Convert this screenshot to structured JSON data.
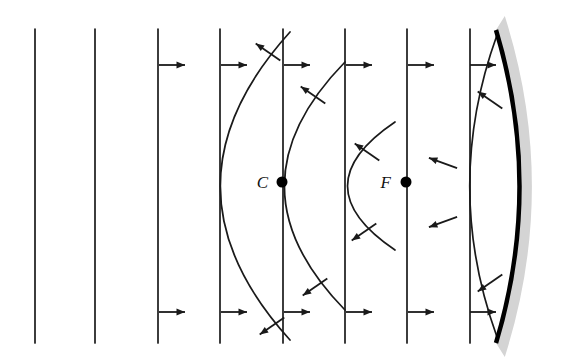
{
  "figure": {
    "background_color": "#ffffff",
    "width": 574,
    "height": 364,
    "stroke_color": "#1a1a1a",
    "mirror_color": "#000000",
    "mirror_backing_color": "#d4d4d4"
  },
  "points": [
    {
      "id": "center-of-curvature",
      "label": "C",
      "label_x": 268,
      "label_y": 188,
      "dot_x": 282,
      "dot_y": 182,
      "dot_r": 5.5
    },
    {
      "id": "focal-point",
      "label": "F",
      "label_x": 391,
      "label_y": 188,
      "dot_x": 406,
      "dot_y": 182,
      "dot_r": 5.5
    }
  ],
  "plane_wavefronts": [
    {
      "id": "plane-1",
      "x": 35,
      "y_top": 29,
      "y_bottom": 343
    },
    {
      "id": "plane-2",
      "x": 95,
      "y_top": 29,
      "y_bottom": 343
    },
    {
      "id": "plane-3",
      "x": 158,
      "y_top": 29,
      "y_bottom": 343
    },
    {
      "id": "plane-4",
      "x": 220,
      "y_top": 29,
      "y_bottom": 343
    },
    {
      "id": "plane-5",
      "x": 283,
      "y_top": 29,
      "y_bottom": 343
    },
    {
      "id": "plane-6",
      "x": 345,
      "y_top": 29,
      "y_bottom": 343
    },
    {
      "id": "plane-7",
      "x": 407,
      "y_top": 29,
      "y_bottom": 343
    },
    {
      "id": "plane-8",
      "x": 470,
      "y_top": 29,
      "y_bottom": 343
    }
  ],
  "curved_wavefronts": [
    {
      "id": "curved-1",
      "apex_x": 221,
      "top_x": 290,
      "bottom_x": 290,
      "y_top": 32,
      "y_bottom": 340
    },
    {
      "id": "curved-2",
      "apex_x": 285,
      "top_x": 345,
      "bottom_x": 345,
      "y_top": 62,
      "y_bottom": 310
    },
    {
      "id": "curved-3",
      "apex_x": 348,
      "top_x": 395,
      "bottom_x": 395,
      "y_top": 122,
      "y_bottom": 250
    },
    {
      "id": "curved-4",
      "apex_x": 470,
      "top_x": 497,
      "bottom_x": 497,
      "y_top": 35,
      "y_bottom": 337
    }
  ],
  "mirror": {
    "id": "concave-mirror",
    "top_x": 496,
    "top_y": 30,
    "bottom_x": 496,
    "bottom_y": 343,
    "apex_x": 543,
    "line_width": 4.5,
    "backing_width": 16
  },
  "incident_arrows": [
    {
      "id": "incident-arrow-top-1",
      "x": 163,
      "y": 65,
      "dir": "right"
    },
    {
      "id": "incident-arrow-top-2",
      "x": 225,
      "y": 65,
      "dir": "right"
    },
    {
      "id": "incident-arrow-top-3",
      "x": 288,
      "y": 65,
      "dir": "right"
    },
    {
      "id": "incident-arrow-top-4",
      "x": 350,
      "y": 65,
      "dir": "right"
    },
    {
      "id": "incident-arrow-top-5",
      "x": 412,
      "y": 65,
      "dir": "right"
    },
    {
      "id": "incident-arrow-top-6",
      "x": 474,
      "y": 65,
      "dir": "right"
    },
    {
      "id": "incident-arrow-bottom-1",
      "x": 163,
      "y": 312,
      "dir": "right"
    },
    {
      "id": "incident-arrow-bottom-2",
      "x": 225,
      "y": 312,
      "dir": "right"
    },
    {
      "id": "incident-arrow-bottom-3",
      "x": 288,
      "y": 312,
      "dir": "right"
    },
    {
      "id": "incident-arrow-bottom-4",
      "x": 350,
      "y": 312,
      "dir": "right"
    },
    {
      "id": "incident-arrow-bottom-5",
      "x": 412,
      "y": 312,
      "dir": "right"
    },
    {
      "id": "incident-arrow-bottom-6",
      "x": 474,
      "y": 312,
      "dir": "right"
    }
  ],
  "reflected_arrows": [
    {
      "id": "reflected-arrow-upper-1",
      "x": 268,
      "y": 52,
      "angle": -145
    },
    {
      "id": "reflected-arrow-upper-2",
      "x": 313,
      "y": 95,
      "angle": -145
    },
    {
      "id": "reflected-arrow-upper-3",
      "x": 367,
      "y": 152,
      "angle": -145
    },
    {
      "id": "reflected-arrow-upper-4",
      "x": 443,
      "y": 163,
      "angle": -160
    },
    {
      "id": "reflected-arrow-upper-5",
      "x": 490,
      "y": 100,
      "angle": -145
    },
    {
      "id": "reflected-arrow-lower-1",
      "x": 272,
      "y": 326,
      "angle": 145
    },
    {
      "id": "reflected-arrow-lower-2",
      "x": 315,
      "y": 287,
      "angle": 145
    },
    {
      "id": "reflected-arrow-lower-3",
      "x": 364,
      "y": 232,
      "angle": 145
    },
    {
      "id": "reflected-arrow-lower-4",
      "x": 443,
      "y": 222,
      "angle": 160
    },
    {
      "id": "reflected-arrow-lower-5",
      "x": 490,
      "y": 283,
      "angle": 145
    }
  ]
}
